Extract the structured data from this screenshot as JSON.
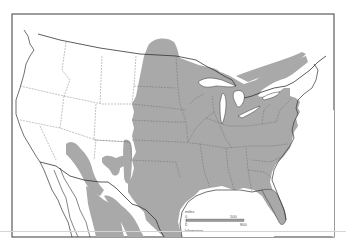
{
  "map": {
    "subject": "Range map of North America (United States and northern Mexico)",
    "colors": {
      "background": "#ffffff",
      "range_fill": "#a9a9a9",
      "border": "#333333",
      "state_border": "#555555",
      "frame": "#3a3a3a"
    },
    "legend": {
      "scale_bar": {
        "miles_label": "miles",
        "miles_start": "0",
        "miles_end": "500",
        "km_start": "0",
        "km_end": "800",
        "km_label": "kilometers"
      }
    },
    "shaded_regions": [
      "central-and-eastern-united-states",
      "great-lakes-and-southern-ontario-quebec",
      "southwest-arizona-new-mexico-patches",
      "northern-mexico"
    ]
  }
}
